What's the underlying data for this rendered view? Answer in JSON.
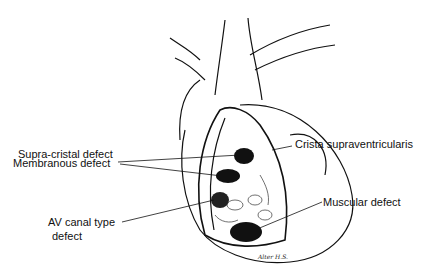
{
  "labels": {
    "supra_cristal": "Supra-cristal defect",
    "crista": "Crista supraventricularis",
    "membranous": "Membranous defect",
    "muscular": "Muscular defect",
    "av_canal_line1": "AV canal type",
    "av_canal_line2": "defect"
  },
  "signature": "Alter H.S."
}
